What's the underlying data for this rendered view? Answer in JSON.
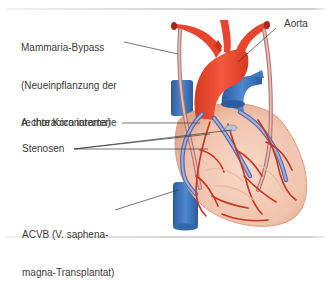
{
  "labels": {
    "mammaria_bypass": {
      "line1": "Mammaria-Bypass",
      "line2": "(Neueinpflanzung der",
      "line3": "A. thoracica interna)"
    },
    "aorta": "Aorta",
    "rechte_koronararterie": "rechte Koronararterie",
    "stenosen": "Stenosen",
    "acvb": {
      "line1": "ACVB (V. saphena-",
      "line2": "magna-Transplantat)"
    }
  },
  "colors": {
    "artery": "#e8442e",
    "artery_dark": "#c8321f",
    "vein": "#3f78c0",
    "vein_dark": "#2c5c9e",
    "myocardium": "#f3c9b4",
    "myocardium_shade": "#e7ac93",
    "coronary": "#c9351f",
    "graft": "#c98e86",
    "saphenous_graft": "#7f8fc2",
    "leader_line": "#3a3a3a",
    "text": "#3a3a3a"
  }
}
